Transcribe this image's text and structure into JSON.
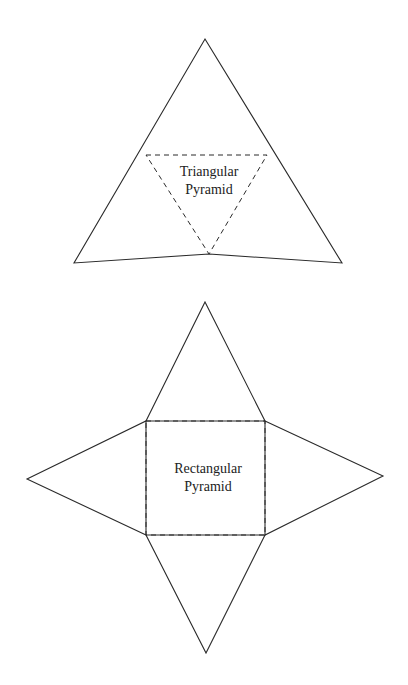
{
  "diagram": {
    "background": "#ffffff",
    "line_color": "#2a2a2a",
    "triangular_net": {
      "label_line1": "Triangular",
      "label_line2": "Pyramid",
      "outline": [
        [
          205,
          39
        ],
        [
          342,
          263
        ],
        [
          209,
          254
        ],
        [
          74,
          263
        ]
      ],
      "fold_lines": [
        [
          146,
          155
        ],
        [
          267,
          155
        ],
        [
          209,
          254
        ]
      ]
    },
    "rectangular_net": {
      "label_line1": "Rectangular",
      "label_line2": "Pyramid",
      "base": {
        "x": 146,
        "y": 421,
        "width": 119,
        "height": 114
      },
      "apexes": {
        "top": [
          205,
          302
        ],
        "right": [
          383,
          476
        ],
        "bottom": [
          206,
          653
        ],
        "left": [
          27,
          479
        ]
      }
    }
  }
}
